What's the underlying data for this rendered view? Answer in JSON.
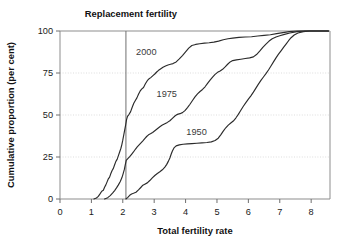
{
  "chart_data": {
    "type": "line",
    "title": "",
    "xlabel": "Total fertility rate",
    "ylabel": "Cumulative proportion (per cent)",
    "xlim": [
      0,
      8.6
    ],
    "ylim": [
      0,
      100
    ],
    "xticks": [
      0,
      1,
      2,
      3,
      4,
      5,
      6,
      7,
      8
    ],
    "xticklabels": [
      "0",
      "1",
      "2",
      "3",
      "4",
      "5",
      "6",
      "7",
      "8"
    ],
    "yticks": [
      0,
      25,
      50,
      75,
      100
    ],
    "yticklabels": [
      "0",
      "25",
      "50",
      "75",
      "100"
    ],
    "grid": "horizontal-dotted",
    "legend_position": "inline-annotations",
    "annotations": [
      {
        "name": "replacement-fertility",
        "text": "Replacement fertility",
        "type": "vertical-line-label",
        "x": 2.1,
        "label_x": 2.1,
        "label_y": 106
      }
    ],
    "series": [
      {
        "name": "2000",
        "label": "2000",
        "label_x": 2.75,
        "label_y": 88,
        "points": [
          [
            1.08,
            0.0
          ],
          [
            1.16,
            0.6
          ],
          [
            1.22,
            1.6
          ],
          [
            1.28,
            3.2
          ],
          [
            1.33,
            4.6
          ],
          [
            1.38,
            5.2
          ],
          [
            1.42,
            7.0
          ],
          [
            1.46,
            8.4
          ],
          [
            1.5,
            10.2
          ],
          [
            1.54,
            12.0
          ],
          [
            1.58,
            13.0
          ],
          [
            1.62,
            15.2
          ],
          [
            1.66,
            17.0
          ],
          [
            1.7,
            18.2
          ],
          [
            1.74,
            20.4
          ],
          [
            1.78,
            22.4
          ],
          [
            1.82,
            23.6
          ],
          [
            1.86,
            25.8
          ],
          [
            1.9,
            28.0
          ],
          [
            1.94,
            30.2
          ],
          [
            1.97,
            32.4
          ],
          [
            2.0,
            35.0
          ],
          [
            2.03,
            38.0
          ],
          [
            2.06,
            41.0
          ],
          [
            2.09,
            44.0
          ],
          [
            2.12,
            47.2
          ],
          [
            2.15,
            49.2
          ],
          [
            2.2,
            50.4
          ],
          [
            2.25,
            52.0
          ],
          [
            2.3,
            54.6
          ],
          [
            2.35,
            57.0
          ],
          [
            2.4,
            58.6
          ],
          [
            2.45,
            60.2
          ],
          [
            2.5,
            62.4
          ],
          [
            2.55,
            64.2
          ],
          [
            2.6,
            65.4
          ],
          [
            2.66,
            66.4
          ],
          [
            2.72,
            68.6
          ],
          [
            2.78,
            70.4
          ],
          [
            2.84,
            71.6
          ],
          [
            2.9,
            72.4
          ],
          [
            2.96,
            73.4
          ],
          [
            3.02,
            74.4
          ],
          [
            3.08,
            75.6
          ],
          [
            3.14,
            76.6
          ],
          [
            3.2,
            77.4
          ],
          [
            3.28,
            78.4
          ],
          [
            3.36,
            79.2
          ],
          [
            3.44,
            79.8
          ],
          [
            3.52,
            80.2
          ],
          [
            3.6,
            80.6
          ],
          [
            3.7,
            81.6
          ],
          [
            3.8,
            83.4
          ],
          [
            3.9,
            85.4
          ],
          [
            4.0,
            87.6
          ],
          [
            4.1,
            89.8
          ],
          [
            4.2,
            91.4
          ],
          [
            4.32,
            92.0
          ],
          [
            4.45,
            92.4
          ],
          [
            4.6,
            92.8
          ],
          [
            4.75,
            93.0
          ],
          [
            4.9,
            93.4
          ],
          [
            5.05,
            94.0
          ],
          [
            5.2,
            94.8
          ],
          [
            5.35,
            95.4
          ],
          [
            5.5,
            95.8
          ],
          [
            5.7,
            96.2
          ],
          [
            5.9,
            96.4
          ],
          [
            6.1,
            96.6
          ],
          [
            6.3,
            97.0
          ],
          [
            6.5,
            97.4
          ],
          [
            6.7,
            97.8
          ],
          [
            6.9,
            98.4
          ],
          [
            7.1,
            99.0
          ],
          [
            7.3,
            99.6
          ],
          [
            7.55,
            100.0
          ],
          [
            8.55,
            100.0
          ]
        ]
      },
      {
        "name": "1975",
        "label": "1975",
        "label_x": 3.4,
        "label_y": 63,
        "points": [
          [
            1.42,
            0.0
          ],
          [
            1.52,
            0.8
          ],
          [
            1.6,
            2.0
          ],
          [
            1.68,
            3.6
          ],
          [
            1.74,
            5.0
          ],
          [
            1.8,
            6.6
          ],
          [
            1.86,
            8.4
          ],
          [
            1.92,
            10.4
          ],
          [
            1.97,
            12.6
          ],
          [
            2.01,
            15.0
          ],
          [
            2.05,
            17.6
          ],
          [
            2.08,
            20.4
          ],
          [
            2.11,
            23.0
          ],
          [
            2.16,
            24.0
          ],
          [
            2.22,
            25.2
          ],
          [
            2.28,
            26.6
          ],
          [
            2.34,
            28.0
          ],
          [
            2.4,
            29.6
          ],
          [
            2.46,
            31.0
          ],
          [
            2.52,
            32.2
          ],
          [
            2.58,
            33.4
          ],
          [
            2.64,
            34.6
          ],
          [
            2.7,
            36.0
          ],
          [
            2.76,
            37.2
          ],
          [
            2.82,
            38.2
          ],
          [
            2.88,
            38.8
          ],
          [
            2.95,
            39.6
          ],
          [
            3.02,
            40.6
          ],
          [
            3.1,
            41.8
          ],
          [
            3.18,
            43.0
          ],
          [
            3.26,
            44.0
          ],
          [
            3.34,
            44.8
          ],
          [
            3.42,
            45.6
          ],
          [
            3.5,
            46.6
          ],
          [
            3.58,
            48.0
          ],
          [
            3.66,
            49.4
          ],
          [
            3.74,
            50.4
          ],
          [
            3.82,
            50.8
          ],
          [
            3.9,
            51.4
          ],
          [
            3.98,
            52.6
          ],
          [
            4.06,
            54.4
          ],
          [
            4.14,
            56.4
          ],
          [
            4.22,
            58.6
          ],
          [
            4.3,
            60.8
          ],
          [
            4.38,
            62.6
          ],
          [
            4.46,
            64.0
          ],
          [
            4.54,
            65.2
          ],
          [
            4.62,
            66.8
          ],
          [
            4.7,
            68.8
          ],
          [
            4.78,
            70.8
          ],
          [
            4.86,
            72.6
          ],
          [
            4.94,
            74.2
          ],
          [
            5.02,
            75.4
          ],
          [
            5.1,
            76.2
          ],
          [
            5.18,
            77.2
          ],
          [
            5.26,
            78.6
          ],
          [
            5.34,
            80.2
          ],
          [
            5.42,
            81.6
          ],
          [
            5.5,
            82.4
          ],
          [
            5.62,
            82.8
          ],
          [
            5.76,
            83.2
          ],
          [
            5.9,
            83.6
          ],
          [
            6.04,
            84.0
          ],
          [
            6.16,
            84.6
          ],
          [
            6.26,
            86.0
          ],
          [
            6.36,
            88.0
          ],
          [
            6.46,
            90.2
          ],
          [
            6.56,
            92.2
          ],
          [
            6.66,
            94.0
          ],
          [
            6.76,
            95.4
          ],
          [
            6.88,
            96.4
          ],
          [
            7.0,
            97.2
          ],
          [
            7.15,
            98.0
          ],
          [
            7.32,
            98.8
          ],
          [
            7.55,
            99.6
          ],
          [
            7.8,
            100.0
          ],
          [
            8.55,
            100.0
          ]
        ]
      },
      {
        "name": "1950",
        "label": "1950",
        "label_x": 4.35,
        "label_y": 40,
        "points": [
          [
            2.1,
            0.0
          ],
          [
            2.16,
            1.0
          ],
          [
            2.22,
            2.2
          ],
          [
            2.28,
            3.0
          ],
          [
            2.34,
            3.4
          ],
          [
            2.42,
            4.0
          ],
          [
            2.5,
            5.4
          ],
          [
            2.58,
            7.0
          ],
          [
            2.64,
            8.2
          ],
          [
            2.7,
            8.8
          ],
          [
            2.78,
            9.6
          ],
          [
            2.86,
            11.0
          ],
          [
            2.94,
            12.6
          ],
          [
            3.02,
            14.0
          ],
          [
            3.1,
            15.2
          ],
          [
            3.18,
            16.2
          ],
          [
            3.26,
            17.4
          ],
          [
            3.34,
            19.0
          ],
          [
            3.4,
            20.6
          ],
          [
            3.45,
            22.4
          ],
          [
            3.5,
            24.4
          ],
          [
            3.54,
            26.6
          ],
          [
            3.58,
            28.6
          ],
          [
            3.63,
            30.4
          ],
          [
            3.7,
            31.6
          ],
          [
            3.8,
            32.2
          ],
          [
            3.92,
            32.6
          ],
          [
            4.06,
            32.8
          ],
          [
            4.2,
            33.0
          ],
          [
            4.36,
            33.2
          ],
          [
            4.52,
            33.4
          ],
          [
            4.68,
            33.6
          ],
          [
            4.82,
            34.0
          ],
          [
            4.94,
            34.8
          ],
          [
            5.04,
            36.2
          ],
          [
            5.12,
            38.2
          ],
          [
            5.2,
            40.4
          ],
          [
            5.28,
            42.4
          ],
          [
            5.36,
            44.0
          ],
          [
            5.44,
            45.2
          ],
          [
            5.52,
            46.4
          ],
          [
            5.6,
            48.2
          ],
          [
            5.68,
            50.4
          ],
          [
            5.76,
            52.8
          ],
          [
            5.84,
            55.2
          ],
          [
            5.92,
            57.4
          ],
          [
            6.0,
            59.4
          ],
          [
            6.08,
            61.4
          ],
          [
            6.16,
            63.6
          ],
          [
            6.24,
            66.0
          ],
          [
            6.32,
            68.4
          ],
          [
            6.4,
            70.6
          ],
          [
            6.48,
            72.6
          ],
          [
            6.56,
            74.6
          ],
          [
            6.64,
            76.8
          ],
          [
            6.72,
            79.2
          ],
          [
            6.8,
            81.6
          ],
          [
            6.88,
            84.0
          ],
          [
            6.96,
            86.2
          ],
          [
            7.04,
            88.2
          ],
          [
            7.12,
            90.2
          ],
          [
            7.2,
            92.2
          ],
          [
            7.28,
            94.2
          ],
          [
            7.36,
            96.0
          ],
          [
            7.46,
            97.6
          ],
          [
            7.58,
            98.8
          ],
          [
            7.75,
            99.6
          ],
          [
            7.95,
            100.0
          ],
          [
            8.55,
            100.0
          ]
        ]
      }
    ],
    "colors": {
      "curve": "#2b2b2b",
      "frame": "#8d8d8d",
      "grid": "#cfcfcf",
      "reference_line": "#6f6f6f",
      "text": "#1a1a1a",
      "series_label": "#3a3a3a",
      "background": "#ffffff"
    }
  }
}
